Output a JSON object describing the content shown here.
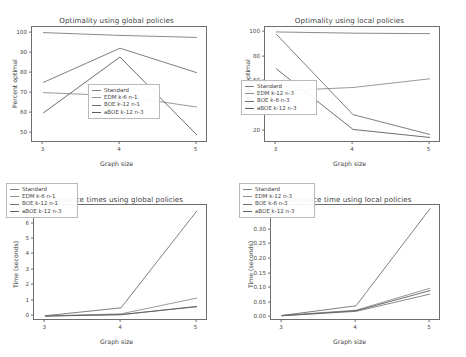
{
  "figure": {
    "xlabel": "Graph size",
    "ylabel_percent": "Percent optimal",
    "ylabel_time": "Time (seconds)",
    "x_categories": [
      "3",
      "4",
      "5"
    ],
    "colors": {
      "standard": "#7d7d7d",
      "edm": "#8f8f8f",
      "boe": "#707070",
      "aboe": "#5e5e5e",
      "axis": "#6e6e6e",
      "text": "#3f3f3f"
    }
  },
  "chart_data": [
    {
      "type": "line",
      "panel": "top-left",
      "title": "Optimality using global policies",
      "xlabel": "Graph size",
      "ylabel": "Percent optimal",
      "x": [
        3,
        4,
        5
      ],
      "xticks": [
        "3",
        "4",
        "5"
      ],
      "yticks": [
        "50",
        "60",
        "70",
        "80",
        "90",
        "100"
      ],
      "ylim": [
        45,
        103
      ],
      "xlim": [
        2.85,
        5.15
      ],
      "grid": false,
      "legend_position": "lower center",
      "series": [
        {
          "name": "Standard",
          "values": [
            100.2,
            98.8,
            97.8
          ]
        },
        {
          "name": "EDM k-6 n-1",
          "values": [
            70.2,
            68.6,
            63.0
          ]
        },
        {
          "name": "BOE k-12 n-1",
          "values": [
            75.3,
            92.4,
            80.2
          ]
        },
        {
          "name": "aBOE k-12 n-3",
          "values": [
            60.1,
            88.0,
            49.2
          ]
        }
      ]
    },
    {
      "type": "line",
      "panel": "top-right",
      "title": "Optimality using local policies",
      "xlabel": "Graph size",
      "ylabel": "Percent optimal",
      "x": [
        3,
        4,
        5
      ],
      "xticks": [
        "3",
        "4",
        "5"
      ],
      "yticks": [
        "20",
        "40",
        "60",
        "80",
        "100"
      ],
      "ylim": [
        10,
        104
      ],
      "xlim": [
        2.85,
        5.15
      ],
      "grid": false,
      "legend_position": "lower left",
      "series": [
        {
          "name": "Standard",
          "values": [
            100.0,
            99.0,
            98.6
          ]
        },
        {
          "name": "EDM k-12 n-3",
          "values": [
            52.2,
            55.0,
            62.0
          ]
        },
        {
          "name": "BOE k-6 n-3",
          "values": [
            98.0,
            33.0,
            17.0
          ]
        },
        {
          "name": "aBOE k-12 n-3",
          "values": [
            70.0,
            21.0,
            14.5
          ]
        }
      ]
    },
    {
      "type": "line",
      "panel": "bottom-left",
      "title": "Inference times using global policies",
      "xlabel": "Graph size",
      "ylabel": "Time (seconds)",
      "x": [
        3,
        4,
        5
      ],
      "xticks": [
        "3",
        "4",
        "5"
      ],
      "yticks": [
        "0",
        "1",
        "2",
        "3",
        "4",
        "5",
        "6",
        "7"
      ],
      "ylim": [
        -0.3,
        7.2
      ],
      "xlim": [
        2.85,
        5.15
      ],
      "grid": false,
      "legend_position": "upper left",
      "series": [
        {
          "name": "Standard",
          "values": [
            0.02,
            0.1,
            0.65
          ]
        },
        {
          "name": "EDM k-6 n-1",
          "values": [
            0.03,
            0.16,
            1.18
          ]
        },
        {
          "name": "BOE k-12 n-1",
          "values": [
            0.04,
            0.55,
            6.8
          ]
        },
        {
          "name": "aBOE k-12 n-3",
          "values": [
            0.02,
            0.12,
            0.62
          ]
        }
      ]
    },
    {
      "type": "line",
      "panel": "bottom-right",
      "title": "Inference time using local policies",
      "xlabel": "Graph size",
      "ylabel": "Time (seconds)",
      "x": [
        3,
        4,
        5
      ],
      "xticks": [
        "3",
        "4",
        "5"
      ],
      "yticks": [
        "0.00",
        "0.05",
        "0.10",
        "0.15",
        "0.20",
        "0.25",
        "0.30",
        "0.35"
      ],
      "ylim": [
        -0.012,
        0.385
      ],
      "xlim": [
        2.85,
        5.15
      ],
      "grid": false,
      "legend_position": "upper left",
      "series": [
        {
          "name": "Standard",
          "values": [
            0.006,
            0.021,
            0.08
          ]
        },
        {
          "name": "EDM k-12 n-3",
          "values": [
            0.007,
            0.025,
            0.1
          ]
        },
        {
          "name": "BOE k-6 n-3",
          "values": [
            0.007,
            0.04,
            0.372
          ]
        },
        {
          "name": "aBOE k-12 n-3",
          "values": [
            0.006,
            0.023,
            0.092
          ]
        }
      ]
    }
  ]
}
